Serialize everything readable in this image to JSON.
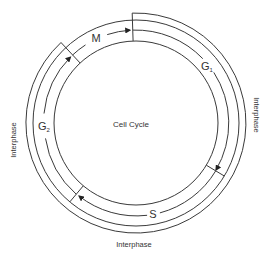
{
  "diagram": {
    "title": "Cell Cycle",
    "center": [
      136,
      123
    ],
    "radii": {
      "inner": 82,
      "track": 93,
      "outer": 103,
      "interphase_bracket": 110
    },
    "phases": [
      {
        "id": "M",
        "label": "M",
        "subscript": "",
        "start_deg": -133,
        "end_deg": -92
      },
      {
        "id": "G1",
        "label": "G",
        "subscript": "1",
        "start_deg": -92,
        "end_deg": 31
      },
      {
        "id": "S",
        "label": "S",
        "subscript": "",
        "start_deg": 31,
        "end_deg": 130
      },
      {
        "id": "G2",
        "label": "G",
        "subscript": "2",
        "start_deg": 130,
        "end_deg": 227
      }
    ],
    "direction": "clockwise",
    "interphase_labels": [
      {
        "text": "Interphase",
        "position": "right"
      },
      {
        "text": "Interphase",
        "position": "bottom"
      },
      {
        "text": "Interphase",
        "position": "left"
      }
    ],
    "colors": {
      "line": "#3a3a3a",
      "text": "#333333",
      "background": "#ffffff"
    }
  }
}
